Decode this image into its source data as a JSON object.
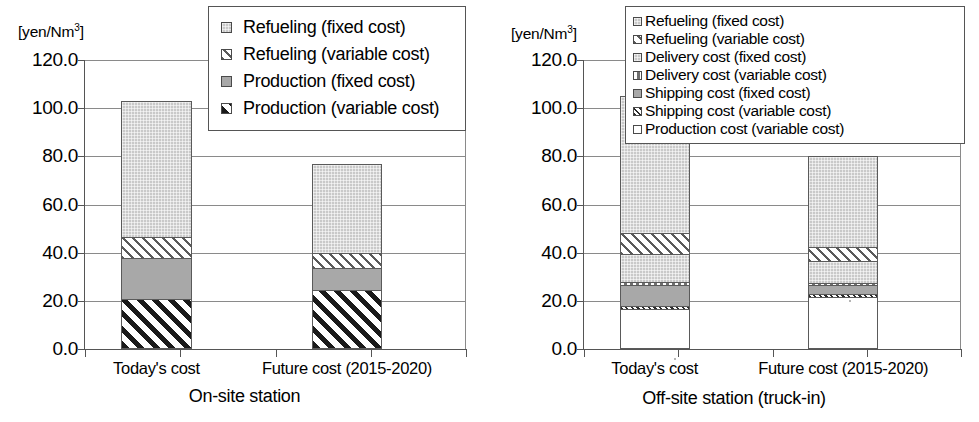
{
  "unit_label": "[yen/Nm",
  "unit_sup": "3",
  "unit_tail": "]",
  "axis": {
    "ticks": [
      "120.0",
      "100.0",
      "80.0",
      "60.0",
      "40.0",
      "20.0",
      "0.0"
    ],
    "min": 0,
    "max": 120,
    "step": 20
  },
  "categories": [
    "Today's cost",
    "Future cost (2015-2020)"
  ],
  "left": {
    "title": "On-site station",
    "legend": [
      {
        "label": "Refueling (fixed cost)",
        "swatch": "f-dotgray"
      },
      {
        "label": "Refueling (variable cost)",
        "swatch": "f-hatch-lite"
      },
      {
        "label": "Production (fixed cost)",
        "swatch": "f-solidgray"
      },
      {
        "label": "Production (variable cost)",
        "swatch": "f-hatch-bold"
      }
    ]
  },
  "right": {
    "title": "Off-site station (truck-in)",
    "legend": [
      {
        "label": "Refueling (fixed cost)",
        "swatch": "f-dotgray"
      },
      {
        "label": "Refueling (variable cost)",
        "swatch": "f-hatch-lite"
      },
      {
        "label": "Delivery cost (fixed cost)",
        "swatch": "f-dotgray"
      },
      {
        "label": "Delivery cost (variable cost)",
        "swatch": "f-vdots"
      },
      {
        "label": "Shipping cost (fixed cost)",
        "swatch": "f-solidgray"
      },
      {
        "label": "Shipping cost (variable cost)",
        "swatch": "f-hatch-fine"
      },
      {
        "label": "Production cost (variable cost)",
        "swatch": "f-white"
      }
    ]
  },
  "chart_data": [
    {
      "type": "bar",
      "title": "On-site station",
      "stacked": true,
      "xlabel": "",
      "ylabel": "[yen/Nm3]",
      "ylim": [
        0,
        120
      ],
      "ytick_step": 20,
      "grid": true,
      "legend_position": "top-right",
      "categories": [
        "Today's cost",
        "Future cost (2015-2020)"
      ],
      "series": [
        {
          "name": "Production (variable cost)",
          "fill": "f-hatch-bold",
          "values": [
            20.8,
            24.5
          ]
        },
        {
          "name": "Production (fixed cost)",
          "fill": "f-solidgray",
          "values": [
            17.0,
            9.0
          ]
        },
        {
          "name": "Refueling (variable cost)",
          "fill": "f-hatch-lite",
          "values": [
            8.7,
            6.5
          ]
        },
        {
          "name": "Refueling (fixed cost)",
          "fill": "f-dotgray",
          "values": [
            56.5,
            37.0
          ]
        }
      ],
      "totals": [
        103.0,
        77.0
      ]
    },
    {
      "type": "bar",
      "title": "Off-site station (truck-in)",
      "stacked": true,
      "xlabel": "",
      "ylabel": "[yen/Nm3]",
      "ylim": [
        0,
        120
      ],
      "ytick_step": 20,
      "grid": true,
      "legend_position": "top-right",
      "categories": [
        "Today's cost",
        "Future cost (2015-2020)"
      ],
      "series": [
        {
          "name": "Production cost (variable cost)",
          "fill": "f-white",
          "values": [
            16.5,
            21.5
          ]
        },
        {
          "name": "Shipping cost (variable cost)",
          "fill": "f-hatch-fine",
          "values": [
            1.5,
            1.5
          ]
        },
        {
          "name": "Shipping cost (fixed cost)",
          "fill": "f-solidgray",
          "values": [
            8.5,
            3.5
          ]
        },
        {
          "name": "Delivery cost (variable cost)",
          "fill": "f-vdots",
          "values": [
            1.3,
            1.0
          ]
        },
        {
          "name": "Delivery cost (fixed cost)",
          "fill": "f-dotgray",
          "values": [
            11.7,
            9.0
          ]
        },
        {
          "name": "Refueling (variable cost)",
          "fill": "f-hatch-lite",
          "values": [
            8.5,
            6.0
          ]
        },
        {
          "name": "Refueling (fixed cost)",
          "fill": "f-dotgray",
          "values": [
            57.0,
            37.5
          ]
        }
      ],
      "totals": [
        105.0,
        80.0
      ]
    }
  ]
}
